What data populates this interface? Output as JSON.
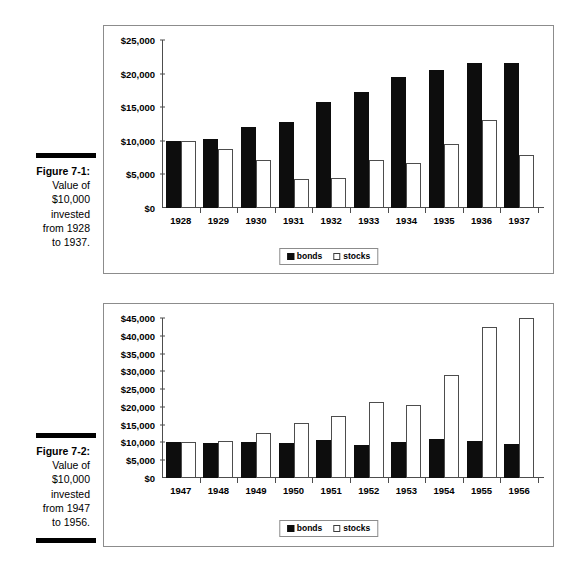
{
  "figures": [
    {
      "id": "figure-1",
      "caption": {
        "title": "Figure 7-1:",
        "lines": [
          "Value of",
          "$10,000",
          "invested",
          "from 1928",
          "to 1937."
        ]
      },
      "legend": [
        {
          "label": "bonds",
          "swatch": "filled-black-square"
        },
        {
          "label": "stocks",
          "swatch": "outlined-white-square"
        }
      ],
      "chart_data": {
        "type": "bar",
        "title": "Value of $10,000 invested from 1928 to 1937",
        "xlabel": "",
        "ylabel": "",
        "grid": false,
        "legend_position": "bottom-center",
        "ylim": [
          0,
          25000
        ],
        "yticks": [
          0,
          5000,
          10000,
          15000,
          20000,
          25000
        ],
        "ytick_labels": [
          "$0",
          "$5,000",
          "$10,000",
          "$15,000",
          "$20,000",
          "$25,000"
        ],
        "categories": [
          "1928",
          "1929",
          "1930",
          "1931",
          "1932",
          "1933",
          "1934",
          "1935",
          "1936",
          "1937"
        ],
        "series": [
          {
            "name": "bonds",
            "color": "#0d0d0d",
            "values": [
              9950,
              10200,
              12000,
              12800,
              15800,
              17300,
              19450,
              20500,
              21600,
              21550
            ]
          },
          {
            "name": "stocks",
            "color": "#ffffff",
            "values": [
              9950,
              8850,
              7150,
              4350,
              4500,
              7100,
              6650,
              9500,
              13150,
              7950
            ]
          }
        ]
      }
    },
    {
      "id": "figure-2",
      "caption": {
        "title": "Figure 7-2:",
        "lines": [
          "Value of",
          "$10,000",
          "invested",
          "from 1947",
          "to 1956."
        ]
      },
      "legend": [
        {
          "label": "bonds",
          "swatch": "filled-black-square"
        },
        {
          "label": "stocks",
          "swatch": "outlined-white-square"
        }
      ],
      "chart_data": {
        "type": "bar",
        "title": "Value of $10,000 invested from 1947 to 1956",
        "xlabel": "",
        "ylabel": "",
        "grid": false,
        "legend_position": "bottom-center",
        "ylim": [
          0,
          45000
        ],
        "yticks": [
          0,
          5000,
          10000,
          15000,
          20000,
          25000,
          30000,
          35000,
          40000,
          45000
        ],
        "ytick_labels": [
          "$0",
          "$5,000",
          "$10,000",
          "$15,000",
          "$20,000",
          "$25,000",
          "$30,000",
          "$35,000",
          "$40,000",
          "$45,000"
        ],
        "categories": [
          "1947",
          "1948",
          "1949",
          "1950",
          "1951",
          "1952",
          "1953",
          "1954",
          "1955",
          "1956"
        ],
        "series": [
          {
            "name": "bonds",
            "color": "#0d0d0d",
            "values": [
              10000,
              9950,
              10000,
              9950,
              10700,
              9150,
              10250,
              11100,
              10450,
              9500
            ]
          },
          {
            "name": "stocks",
            "color": "#ffffff",
            "values": [
              10000,
              10300,
              12550,
              15500,
              17450,
              21300,
              20650,
              28950,
              42500,
              45100
            ]
          }
        ]
      }
    }
  ]
}
